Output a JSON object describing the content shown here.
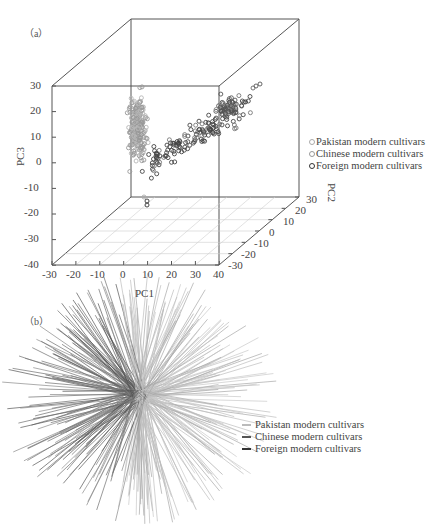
{
  "chart_data": [
    {
      "panel": "(a)",
      "type": "scatter",
      "subtype": "3d-scatter",
      "xlabel": "PC1",
      "ylabel": "PC2",
      "zlabel": "PC3",
      "xticks": [
        "-30",
        "-20",
        "-10",
        "0",
        "10",
        "20",
        "30",
        "40"
      ],
      "yticks": [
        "-30",
        "-20",
        "-10",
        "0",
        "10",
        "20",
        "30"
      ],
      "zticks": [
        "-40",
        "-30",
        "-20",
        "-10",
        "0",
        "10",
        "20",
        "30"
      ],
      "xlim": [
        -30,
        40
      ],
      "ylim": [
        -30,
        30
      ],
      "zlim": [
        -40,
        30
      ],
      "grid": "floor only",
      "legend_position": "right",
      "series": [
        {
          "name": "Pakistan modern cultivars",
          "color": "#b0b0b0",
          "description": "dense vertical cluster near PC1≈0–10, PC3 -15 to 32"
        },
        {
          "name": "Chinese modern cultivars",
          "color": "#8a8a8a",
          "description": "mixed with Pakistan cluster, PC1≈0–10"
        },
        {
          "name": "Foreign modern cultivars",
          "color": "#333333",
          "description": "spread from PC1≈10 to 40, PC3 -15 to 25, diagonal band toward back-right"
        }
      ]
    },
    {
      "panel": "(b)",
      "type": "tree",
      "subtype": "unrooted radial phylogenetic tree",
      "legend_position": "right",
      "series": [
        {
          "name": "Pakistan modern cultivars",
          "color": "#bdbdbd"
        },
        {
          "name": "Chinese modern cultivars",
          "color": "#7a7a7a"
        },
        {
          "name": "Foreign modern cultivars",
          "color": "#444444"
        }
      ]
    }
  ],
  "panel_a": {
    "label": "（a）",
    "xlabel": "PC1",
    "ylabel": "PC2",
    "zlabel": "PC3",
    "zticks": [
      "30",
      "20",
      "10",
      "0",
      "-10",
      "-20",
      "-30",
      "-40"
    ],
    "xticks": [
      "-30",
      "-20",
      "-10",
      "0",
      "10",
      "20",
      "30",
      "40"
    ],
    "yticks": [
      "30",
      "20",
      "10",
      "0",
      "-10",
      "-20",
      "-30"
    ],
    "legend": [
      "Pakistan modern cultivars",
      "Chinese modern cultivars",
      "Foreign modern cultivars"
    ]
  },
  "panel_b": {
    "label": "（b）",
    "legend": [
      "Pakistan modern cultivars",
      "Chinese modern cultivars",
      "Foreign modern cultivars"
    ]
  }
}
